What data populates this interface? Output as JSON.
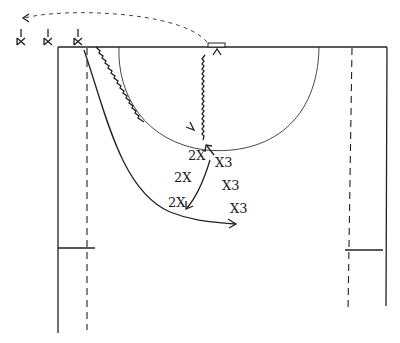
{
  "diagram": {
    "type": "basketball play diagram (hand-drawn)",
    "court": {
      "baseline_y": 47,
      "left_sideline_x": 58,
      "right_sideline_x": 387,
      "free_throw_semicircle": {
        "cx": 220,
        "cy": 47,
        "r": 100
      },
      "backboard": {
        "x": 208,
        "y": 43,
        "w": 17,
        "h": 4
      }
    },
    "offense_players": [
      {
        "id": "o1",
        "label": "X",
        "x": 20,
        "y": 40
      },
      {
        "id": "o2",
        "label": "X",
        "x": 47,
        "y": 40
      },
      {
        "id": "o3",
        "label": "X",
        "x": 77,
        "y": 40
      }
    ],
    "defense_labels": [
      {
        "id": "d1",
        "text": "2X",
        "x": 188,
        "y": 160
      },
      {
        "id": "d2",
        "text": "X3",
        "x": 215,
        "y": 167
      },
      {
        "id": "d3",
        "text": "2X",
        "x": 174,
        "y": 182
      },
      {
        "id": "d4",
        "text": "X3",
        "x": 222,
        "y": 190
      },
      {
        "id": "d5",
        "text": "2X",
        "x": 168,
        "y": 207
      },
      {
        "id": "d6",
        "text": "X3",
        "x": 230,
        "y": 213
      }
    ]
  }
}
